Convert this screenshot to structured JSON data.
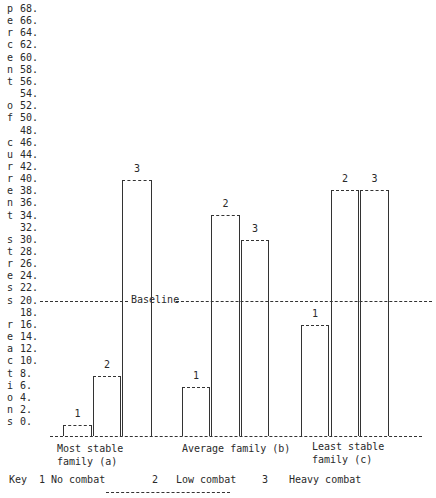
{
  "chart_data": {
    "type": "bar",
    "title": "",
    "ylabel": "percent of current stress reactions",
    "xlabel": "",
    "ylim": [
      0,
      68
    ],
    "yticks": [
      "68.",
      "66.",
      "64.",
      "62.",
      "60.",
      "58.",
      "56.",
      "54.",
      "52.",
      "50.",
      "48.",
      "46.",
      "44.",
      "42.",
      "40.",
      "38.",
      "36.",
      "34.",
      "32.",
      "30.",
      "28.",
      "26.",
      "24.",
      "22.",
      "20.",
      "18.",
      "16.",
      "14.",
      "12.",
      "10.",
      "8.",
      "6.",
      "4.",
      "2.",
      "0."
    ],
    "categories": [
      "Most stable family (a)",
      "Average family (b)",
      "Least stable family (c)"
    ],
    "series": [
      {
        "name": "1 No combat",
        "values": [
          2,
          6,
          16
        ]
      },
      {
        "name": "2 Low combat",
        "values": [
          8,
          34,
          38
        ]
      },
      {
        "name": "3 Heavy combat",
        "values": [
          40,
          30,
          38
        ]
      }
    ],
    "baseline": {
      "label": "Baseline",
      "value": 20
    },
    "legend": {
      "title": "Key",
      "entries": [
        {
          "num": "1",
          "label": "No combat"
        },
        {
          "num": "2",
          "label": "Low combat"
        },
        {
          "num": "3",
          "label": "Heavy combat"
        }
      ],
      "position": "bottom"
    },
    "grid": false
  },
  "axis_letters": [
    "p",
    "e",
    "r",
    "c",
    "e",
    "n",
    "t",
    "",
    "o",
    "f",
    "",
    "c",
    "u",
    "r",
    "r",
    "e",
    "n",
    "t",
    "",
    "s",
    "t",
    "r",
    "e",
    "s",
    "s",
    "",
    "r",
    "e",
    "a",
    "c",
    "t",
    "i",
    "o",
    "n",
    "s"
  ],
  "group_labels": [
    {
      "line1": "Most stable",
      "line2": "family (a)"
    },
    {
      "line1": "Average family (b)",
      "line2": ""
    },
    {
      "line1": "Least stable",
      "line2": "family (c)"
    }
  ],
  "bar_labels": [
    "1",
    "2",
    "3"
  ],
  "baseline_text": "Baseline",
  "key": {
    "title": "Key",
    "n1": "1",
    "l1": "No combat",
    "n2": "2",
    "l2": "Low combat",
    "n3": "3",
    "l3": "Heavy combat"
  }
}
